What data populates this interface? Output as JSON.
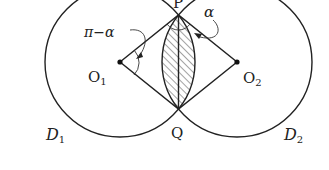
{
  "diagram": {
    "type": "geometry",
    "labels": {
      "P": "P",
      "Q": "Q",
      "O1_main": "O",
      "O1_sub": "1",
      "O2_main": "O",
      "O2_sub": "2",
      "D1_main": "D",
      "D1_sub": "1",
      "D2_main": "D",
      "D2_sub": "2",
      "angle_alpha": "α",
      "angle_pi_minus_alpha": "π−α"
    },
    "points": {
      "O1": [
        120,
        62
      ],
      "O2": [
        237,
        62
      ],
      "P": [
        178.5,
        15
      ],
      "Q": [
        178.5,
        109
      ]
    },
    "circles": [
      {
        "name": "D1",
        "center": "O1",
        "radius": 75
      },
      {
        "name": "D2",
        "center": "O2",
        "radius": 75
      }
    ],
    "colors": {
      "line": "#222222",
      "background": "#ffffff"
    }
  }
}
